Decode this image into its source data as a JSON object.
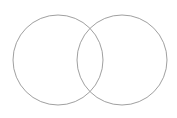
{
  "diagram": {
    "type": "venn",
    "sets": [
      {
        "name": "left-set",
        "cx": 58,
        "cy": 60,
        "r": 45
      },
      {
        "name": "right-set",
        "cx": 122,
        "cy": 60,
        "r": 45
      }
    ],
    "stroke_color": "#a0a0a0",
    "background": "#ffffff"
  }
}
